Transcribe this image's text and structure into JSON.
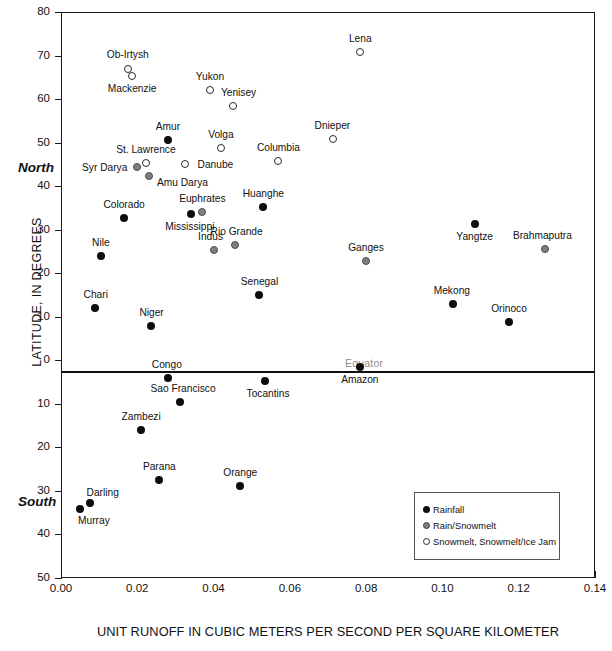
{
  "chart_data": {
    "type": "scatter",
    "title": "",
    "xlabel": "UNIT RUNOFF IN CUBIC METERS PER SECOND PER SQUARE KILOMETER",
    "ylabel": "LATITUDE, IN DEGREES",
    "xlim": [
      0.0,
      0.14
    ],
    "ylim": [
      -50,
      80
    ],
    "xticks": [
      "0.00",
      "0.02",
      "0.04",
      "0.06",
      "0.08",
      "0.10",
      "0.12",
      "0.14"
    ],
    "xtick_values": [
      0.0,
      0.02,
      0.04,
      0.06,
      0.08,
      0.1,
      0.12,
      0.14
    ],
    "yticks": [
      "80",
      "70",
      "60",
      "50",
      "40",
      "30",
      "20",
      "10",
      "0",
      "10",
      "20",
      "30",
      "40",
      "50"
    ],
    "ytick_values": [
      80,
      70,
      60,
      50,
      40,
      30,
      20,
      10,
      0,
      -10,
      -20,
      -30,
      -40,
      -50
    ],
    "grid": false,
    "annotations": {
      "equator": "Equator",
      "north": "North",
      "south": "South"
    },
    "legend_position": "bottom-right",
    "legend": [
      {
        "key": "rain",
        "label": "Rainfall"
      },
      {
        "key": "mix",
        "label": "Rain/Snowmelt"
      },
      {
        "key": "snow",
        "label": "Snowmelt, Snowmelt/Ice Jam"
      }
    ],
    "colors": {
      "rain": "#0d0d0d",
      "mix": "#808080",
      "snow": "#ffffff",
      "outline": "#2b2b2b",
      "axis": "#1a1a1a",
      "equator_label": "#8d8d8d"
    },
    "points": [
      {
        "name": "Lena",
        "x": 0.0785,
        "y": 70.8,
        "group": "snow",
        "lx": 0,
        "ly": -13
      },
      {
        "name": "Ob-Irtysh",
        "x": 0.0175,
        "y": 66.8,
        "group": "snow",
        "lx": 0,
        "ly": -14
      },
      {
        "name": "Mackenzie",
        "x": 0.0187,
        "y": 65.3,
        "group": "snow",
        "lx": 0,
        "ly": 13
      },
      {
        "name": "Yukon",
        "x": 0.039,
        "y": 62.0,
        "group": "snow",
        "lx": 0,
        "ly": -13
      },
      {
        "name": "Yenisey",
        "x": 0.0452,
        "y": 58.5,
        "group": "snow",
        "lx": 5,
        "ly": -13
      },
      {
        "name": "Amur",
        "x": 0.028,
        "y": 50.7,
        "group": "rain",
        "lx": 0,
        "ly": -13
      },
      {
        "name": "Dnieper",
        "x": 0.0712,
        "y": 50.9,
        "group": "snow",
        "lx": 0,
        "ly": -13
      },
      {
        "name": "Volga",
        "x": 0.042,
        "y": 48.8,
        "group": "snow",
        "lx": 0,
        "ly": -13
      },
      {
        "name": "Columbia",
        "x": 0.057,
        "y": 45.8,
        "group": "snow",
        "lx": 0,
        "ly": -13
      },
      {
        "name": "St. Lawrence",
        "x": 0.0222,
        "y": 45.4,
        "group": "snow",
        "lx": 0,
        "ly": -13
      },
      {
        "name": "Danube",
        "x": 0.0324,
        "y": 45.0,
        "group": "snow",
        "lx": 31,
        "ly": 1
      },
      {
        "name": "Syr Darya",
        "x": 0.0198,
        "y": 44.3,
        "group": "mix",
        "lx": -32,
        "ly": 1
      },
      {
        "name": "Amu Darya",
        "x": 0.0232,
        "y": 42.3,
        "group": "mix",
        "lx": 33,
        "ly": 7
      },
      {
        "name": "Huanghe",
        "x": 0.053,
        "y": 35.2,
        "group": "rain",
        "lx": 0,
        "ly": -13
      },
      {
        "name": "Euphrates",
        "x": 0.037,
        "y": 34.0,
        "group": "mix",
        "lx": 0,
        "ly": -13
      },
      {
        "name": "Mississippi",
        "x": 0.034,
        "y": 33.5,
        "group": "rain",
        "lx": -1,
        "ly": 13
      },
      {
        "name": "Colorado",
        "x": 0.0165,
        "y": 32.6,
        "group": "rain",
        "lx": 0,
        "ly": -13
      },
      {
        "name": "Rio Grande",
        "x": 0.0455,
        "y": 26.4,
        "group": "mix",
        "lx": 2,
        "ly": -13
      },
      {
        "name": "Brahmaputra",
        "x": 0.127,
        "y": 25.5,
        "group": "mix",
        "lx": -3,
        "ly": -13
      },
      {
        "name": "Indus",
        "x": 0.04,
        "y": 25.3,
        "group": "mix",
        "lx": -3,
        "ly": -13
      },
      {
        "name": "Nile",
        "x": 0.0105,
        "y": 24.0,
        "group": "rain",
        "lx": 0,
        "ly": -13
      },
      {
        "name": "Ganges",
        "x": 0.08,
        "y": 22.7,
        "group": "mix",
        "lx": 0,
        "ly": -13
      },
      {
        "name": "Yangtze",
        "x": 0.1085,
        "y": 31.3,
        "group": "rain",
        "lx": 0,
        "ly": 13
      },
      {
        "name": "Senegal",
        "x": 0.052,
        "y": 15.1,
        "group": "rain",
        "lx": 0,
        "ly": -13
      },
      {
        "name": "Mekong",
        "x": 0.1027,
        "y": 12.9,
        "group": "rain",
        "lx": -1,
        "ly": -13
      },
      {
        "name": "Chari",
        "x": 0.0088,
        "y": 12.0,
        "group": "rain",
        "lx": 1,
        "ly": -13
      },
      {
        "name": "Orinoco",
        "x": 0.1175,
        "y": 8.8,
        "group": "rain",
        "lx": 0,
        "ly": -13
      },
      {
        "name": "Niger",
        "x": 0.0237,
        "y": 7.8,
        "group": "rain",
        "lx": 0,
        "ly": -13
      },
      {
        "name": "Amazon",
        "x": 0.0783,
        "y": -1.6,
        "group": "rain",
        "lx": 0,
        "ly": 13
      },
      {
        "name": "Congo",
        "x": 0.028,
        "y": -4.1,
        "group": "rain",
        "lx": -1,
        "ly": -13
      },
      {
        "name": "Tocantins",
        "x": 0.0535,
        "y": -4.8,
        "group": "rain",
        "lx": 3,
        "ly": 13
      },
      {
        "name": "Sao Francisco",
        "x": 0.0312,
        "y": -9.6,
        "group": "rain",
        "lx": 3,
        "ly": -13
      },
      {
        "name": "Zambezi",
        "x": 0.021,
        "y": -16.1,
        "group": "rain",
        "lx": 0,
        "ly": -13
      },
      {
        "name": "Orange",
        "x": 0.047,
        "y": -28.9,
        "group": "rain",
        "lx": 0,
        "ly": -13
      },
      {
        "name": "Parana",
        "x": 0.0258,
        "y": -27.5,
        "group": "rain",
        "lx": 0,
        "ly": -13
      },
      {
        "name": "Darling",
        "x": 0.0075,
        "y": -32.7,
        "group": "rain",
        "lx": 13,
        "ly": -10
      },
      {
        "name": "Murray",
        "x": 0.005,
        "y": -34.2,
        "group": "rain",
        "lx": 14,
        "ly": 12
      }
    ]
  },
  "footer": {
    "caption": ""
  }
}
